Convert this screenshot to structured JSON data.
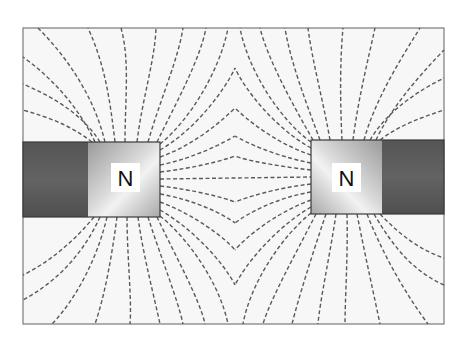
{
  "diagram": {
    "frame": {
      "x": 23,
      "y": 28,
      "width": 421,
      "height": 296,
      "fill": "#f7f7f7",
      "stroke": "#7a7a7a"
    },
    "field_line_color": "#5a5a5a",
    "magnets": [
      {
        "id": "left",
        "pole_label": "N",
        "body": {
          "x": 23,
          "y": 142,
          "width": 137,
          "height": 75
        },
        "dark_section": {
          "x": 23,
          "width": 65,
          "color": "#5c5c5c"
        },
        "pole_section": {
          "x": 88,
          "width": 72,
          "color": "#bdbdbd"
        },
        "label_box": {
          "x": 111,
          "y": 163,
          "width": 29,
          "height": 29
        }
      },
      {
        "id": "right",
        "pole_label": "N",
        "body": {
          "x": 311,
          "y": 140,
          "width": 133,
          "height": 74
        },
        "pole_section": {
          "x": 311,
          "width": 71,
          "color": "#bdbdbd"
        },
        "dark_section": {
          "x": 382,
          "width": 62,
          "color": "#5c5c5c"
        },
        "label_box": {
          "x": 332,
          "y": 163,
          "width": 29,
          "height": 29
        }
      }
    ],
    "field_pattern": "repulsion",
    "neutral_axis_x": 235
  }
}
